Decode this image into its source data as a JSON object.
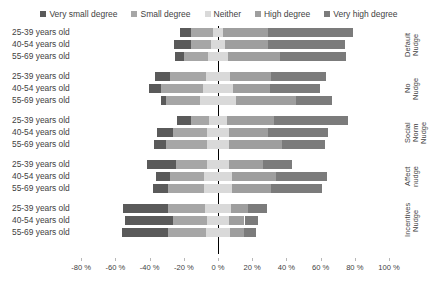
{
  "chart_data": {
    "type": "bar",
    "subtype": "diverging-stacked-bar",
    "title": "",
    "subtitle": "",
    "xlabel": "",
    "ylabel": "",
    "orientation": "horizontal",
    "stacked": true,
    "grid": false,
    "legend_position": "top",
    "xlim": [
      -80,
      100
    ],
    "xticks": [
      -80,
      -60,
      -40,
      -20,
      0,
      20,
      40,
      60,
      80,
      100
    ],
    "xtick_labels": [
      "-80 %",
      "-60 %",
      "-40 %",
      "-20 %",
      "0 %",
      "20 %",
      "40 %",
      "60 %",
      "80 %",
      "100 %"
    ],
    "legend": [
      {
        "name": "Very small degree",
        "color": "#5a5a5a"
      },
      {
        "name": "Small degree",
        "color": "#a6a6a6"
      },
      {
        "name": "Neither",
        "color": "#d9d9d9"
      },
      {
        "name": "High degree",
        "color": "#9e9e9e"
      },
      {
        "name": "Very high degree",
        "color": "#7b7b7b"
      }
    ],
    "series": [
      {
        "name": "Very small degree",
        "color": "#5a5a5a"
      },
      {
        "name": "Small degree",
        "color": "#a6a6a6"
      },
      {
        "name": "Neither",
        "color": "#d9d9d9"
      },
      {
        "name": "High degree",
        "color": "#9e9e9e"
      },
      {
        "name": "Very high degree",
        "color": "#7b7b7b"
      }
    ],
    "groups": [
      {
        "label": "Default\nNudge",
        "rows": [
          {
            "category": "25-39 years old",
            "values": [
              6,
              13,
              6,
              26,
              50
            ]
          },
          {
            "category": "40-54 years old",
            "values": [
              10,
              12,
              8,
              25,
              45
            ]
          },
          {
            "category": "55-69 years old",
            "values": [
              5,
              14,
              12,
              30,
              39
            ]
          }
        ]
      },
      {
        "label": "No\nNudge",
        "rows": [
          {
            "category": "25-39 years old",
            "values": [
              9,
              21,
              14,
              24,
              32
            ]
          },
          {
            "category": "40-54 years old",
            "values": [
              7,
              25,
              17,
              22,
              29
            ]
          },
          {
            "category": "55-69 years old",
            "values": [
              3,
              20,
              21,
              35,
              21
            ]
          }
        ]
      },
      {
        "label": "Social Norm\nNudge",
        "rows": [
          {
            "category": "25-39 years old",
            "values": [
              8,
              11,
              10,
              28,
              43
            ]
          },
          {
            "category": "40-54 years old",
            "values": [
              9,
              20,
              13,
              23,
              35
            ]
          },
          {
            "category": "55-69 years old",
            "values": [
              7,
              24,
              13,
              31,
              25
            ]
          }
        ]
      },
      {
        "label": "Affect\nnudge",
        "rows": [
          {
            "category": "25-39 years old",
            "values": [
              17,
              18,
              13,
              20,
              17
            ]
          },
          {
            "category": "40-54 years old",
            "values": [
              8,
              20,
              16,
              26,
              30
            ]
          },
          {
            "category": "55-69 years old",
            "values": [
              9,
              21,
              16,
              23,
              30
            ]
          }
        ]
      },
      {
        "label": "Incentives\nNudge",
        "rows": [
          {
            "category": "25-39 years old",
            "values": [
              26,
              22,
              15,
              10,
              11
            ]
          },
          {
            "category": "40-54 years old",
            "values": [
              28,
              20,
              13,
              9,
              8
            ]
          },
          {
            "category": "55-69 years old",
            "values": [
              27,
              22,
              14,
              8,
              7
            ]
          }
        ]
      }
    ]
  },
  "legend": {
    "items": [
      {
        "label": "Very small degree",
        "icon": "square-swatch-icon"
      },
      {
        "label": "Small degree",
        "icon": "square-swatch-icon"
      },
      {
        "label": "Neither",
        "icon": "square-swatch-icon"
      },
      {
        "label": "High degree",
        "icon": "square-swatch-icon"
      },
      {
        "label": "Very high degree",
        "icon": "square-swatch-icon"
      }
    ]
  }
}
